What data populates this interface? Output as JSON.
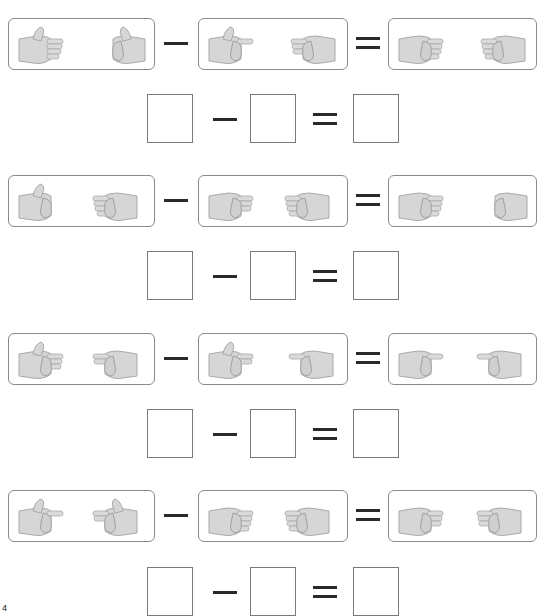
{
  "worksheet": {
    "type": "finger-counting subtraction",
    "colors": {
      "hand_fill": "#d6d6d6",
      "hand_stroke": "#a9a9a9",
      "border": "#8a8a8a",
      "operator": "#2a2a2a"
    },
    "operators": {
      "minus": "−",
      "equals": "="
    },
    "problems": [
      {
        "minuend": {
          "hands": [
            {
              "gesture": "thumb-up-flat-hand",
              "direction": "right",
              "fingers": 5
            },
            {
              "gesture": "thumbs-up-fist",
              "direction": "left",
              "fingers": 1
            }
          ]
        },
        "subtrahend": {
          "hands": [
            {
              "gesture": "pointing-thumb-up",
              "direction": "right",
              "fingers": 2
            },
            {
              "gesture": "three-fingers-sideways",
              "direction": "left",
              "fingers": 3
            }
          ]
        },
        "result": {
          "hands": [
            {
              "gesture": "four-fingers-sideways",
              "direction": "right",
              "fingers": 4
            },
            {
              "gesture": "four-fingers-sideways",
              "direction": "left",
              "fingers": 4
            }
          ]
        },
        "answer": {
          "a": "",
          "b": "",
          "c": ""
        }
      },
      {
        "minuend": {
          "hands": [
            {
              "gesture": "thumbs-up-fist",
              "direction": "right",
              "fingers": 1
            },
            {
              "gesture": "four-fingers-sideways",
              "direction": "left",
              "fingers": 4
            }
          ]
        },
        "subtrahend": {
          "hands": [
            {
              "gesture": "three-fingers-sideways",
              "direction": "right",
              "fingers": 3
            },
            {
              "gesture": "four-fingers-sideways",
              "direction": "left",
              "fingers": 4
            }
          ]
        },
        "result": {
          "hands": [
            {
              "gesture": "four-fingers-sideways",
              "direction": "right",
              "fingers": 4
            },
            {
              "gesture": "fist",
              "direction": "left",
              "fingers": 0
            }
          ]
        },
        "answer": {
          "a": "",
          "b": "",
          "c": ""
        }
      },
      {
        "minuend": {
          "hands": [
            {
              "gesture": "thumb-up-three-fingers",
              "direction": "right",
              "fingers": 4
            },
            {
              "gesture": "two-fingers-sideways",
              "direction": "left",
              "fingers": 2
            }
          ]
        },
        "subtrahend": {
          "hands": [
            {
              "gesture": "thumb-up-two-fingers",
              "direction": "right",
              "fingers": 3
            },
            {
              "gesture": "one-finger-pointing",
              "direction": "left",
              "fingers": 1
            }
          ]
        },
        "result": {
          "hands": [
            {
              "gesture": "one-finger-pointing",
              "direction": "right",
              "fingers": 1
            },
            {
              "gesture": "one-finger-pointing",
              "direction": "left",
              "fingers": 1
            }
          ]
        },
        "answer": {
          "a": "",
          "b": "",
          "c": ""
        }
      },
      {
        "minuend": {
          "hands": [
            {
              "gesture": "pointing-thumb-up",
              "direction": "right",
              "fingers": 2
            },
            {
              "gesture": "thumb-up-two-fingers",
              "direction": "left",
              "fingers": 3
            }
          ]
        },
        "subtrahend": {
          "hands": [
            {
              "gesture": "four-fingers-sideways",
              "direction": "right",
              "fingers": 4
            },
            {
              "gesture": "four-fingers-sideways",
              "direction": "left",
              "fingers": 4
            }
          ]
        },
        "result": {
          "hands": [
            {
              "gesture": "three-fingers-sideways",
              "direction": "right",
              "fingers": 3
            },
            {
              "gesture": "three-fingers-sideways",
              "direction": "left",
              "fingers": 3
            }
          ]
        },
        "answer": {
          "a": "",
          "b": "",
          "c": ""
        }
      }
    ],
    "corner_mark": "4"
  }
}
